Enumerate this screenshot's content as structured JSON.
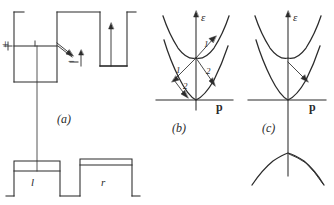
{
  "figure": {
    "panels": [
      {
        "id": "a",
        "label": "(a)"
      },
      {
        "id": "b",
        "label": "(b)"
      },
      {
        "id": "c",
        "label": "(c)"
      }
    ]
  },
  "panel_a": {
    "label": "(a)",
    "plus_sign": "+",
    "minus_sign": "−",
    "left_region_label": "l",
    "right_region_label": "r",
    "description": "Potential profile with barrier; occupied level on left, level on right, diagonal tunneling arrow and vertical arrows"
  },
  "panel_b": {
    "label": "(b)",
    "axis_energy": "ε",
    "axis_momentum": "p",
    "arrow_labels": [
      "1",
      "2",
      "1",
      "2"
    ]
  },
  "panel_c": {
    "label": "(c)",
    "axis_energy": "ε",
    "axis_momentum": "p"
  },
  "colors": {
    "ink": "#1b1b1b",
    "line": "#2b2b2b",
    "background": "#ffffff"
  }
}
